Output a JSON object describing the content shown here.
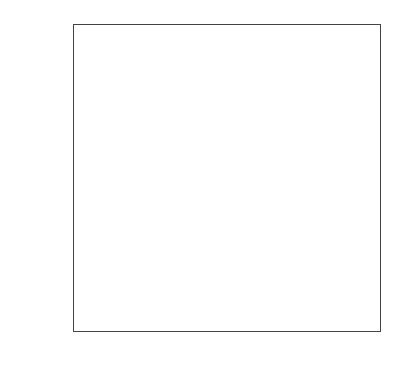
{
  "chart_data": {
    "type": "heatmap",
    "title": "",
    "xlabel": "",
    "ylabel": "",
    "x_categories": [
      "cf=0",
      "cf=1",
      "cf=2",
      "cf=3"
    ],
    "y_categories": [
      "cp=0",
      "cp=1",
      "cp=2",
      "cp=3"
    ],
    "values": [
      [
        8.9,
        8.8,
        8.6,
        8.9
      ],
      [
        8.8,
        9.3,
        8.9,
        9.4
      ],
      [
        9.4,
        9.2,
        9.7,
        9.6
      ],
      [
        8.8,
        9.6,
        9.5,
        9.4
      ]
    ],
    "colors": [
      [
        "#fefefe",
        "#ffffff",
        "#e6e6e6",
        "#ffffff"
      ],
      [
        "#f4f4f4",
        "#bdbdbd",
        "#ffffff",
        "#b0b0b0"
      ],
      [
        "#b0b0b0",
        "#dcdcdc",
        "#8a8a8a",
        "#999999"
      ],
      [
        "#f4f4f4",
        "#a0a0a0",
        "#acacac",
        "#b8b8b8"
      ]
    ],
    "colormap": "Greys",
    "colorbar": false
  }
}
